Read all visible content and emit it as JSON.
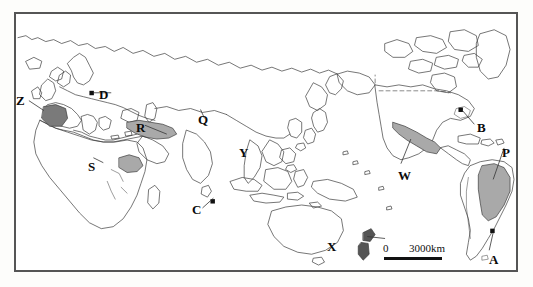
{
  "figure": {
    "kind": "world-map",
    "projection_note": "Pacific-centred world outline map",
    "background_color": "#ffffff",
    "frame_color": "#555555",
    "coastline_color": "#3a3a3a",
    "highlight_fill_color": "#a9a9a9",
    "dark_fill_color": "#555555",
    "point_marker_color": "#111111"
  },
  "scalebar": {
    "zero_label": "0",
    "max_label": "3000km"
  },
  "labels": [
    {
      "id": "Z",
      "text": "Z",
      "x": 18,
      "y": 94,
      "target": "iberian-peninsula"
    },
    {
      "id": "D",
      "text": "D",
      "x": 99,
      "y": 88,
      "target": "central-europe-point"
    },
    {
      "id": "R",
      "text": "R",
      "x": 136,
      "y": 121,
      "target": "anatolia-turkey"
    },
    {
      "id": "Q",
      "text": "Q",
      "x": 196,
      "y": 113,
      "target": "korean-peninsula"
    },
    {
      "id": "Y",
      "text": "Y",
      "x": 237,
      "y": 146,
      "target": "philippines"
    },
    {
      "id": "S",
      "text": "S",
      "x": 86,
      "y": 160,
      "target": "horn-of-africa"
    },
    {
      "id": "C",
      "text": "C",
      "x": 190,
      "y": 203,
      "target": "java-point"
    },
    {
      "id": "X",
      "text": "X",
      "x": 325,
      "y": 240,
      "target": "new-zealand"
    },
    {
      "id": "W",
      "text": "W",
      "x": 396,
      "y": 169,
      "target": "mexico"
    },
    {
      "id": "B",
      "text": "B",
      "x": 475,
      "y": 121,
      "target": "great-lakes-point"
    },
    {
      "id": "P",
      "text": "P",
      "x": 500,
      "y": 146,
      "target": "brazil"
    },
    {
      "id": "A",
      "text": "A",
      "x": 487,
      "y": 253,
      "target": "rio-de-la-plata-point"
    }
  ]
}
